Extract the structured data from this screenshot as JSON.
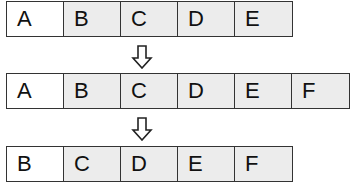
{
  "diagram": {
    "rows": [
      {
        "cells": [
          "A",
          "B",
          "C",
          "D",
          "E"
        ]
      },
      {
        "cells": [
          "A",
          "B",
          "C",
          "D",
          "E",
          "F"
        ]
      },
      {
        "cells": [
          "B",
          "C",
          "D",
          "E",
          "F"
        ]
      }
    ],
    "arrows": [
      "down-arrow-icon",
      "down-arrow-icon"
    ],
    "colors": {
      "first_cell": "#ffffff",
      "other_cells": "#ececec",
      "border": "#333333"
    }
  }
}
